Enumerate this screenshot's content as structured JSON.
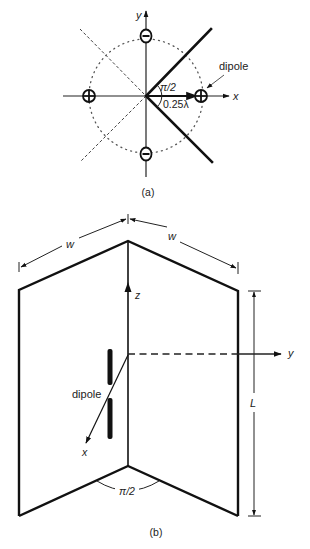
{
  "figure": {
    "part_a": {
      "caption": "(a)",
      "axis_x_label": "x",
      "axis_y_label": "y",
      "angle_label": "π/2",
      "distance_label": "0.25λ",
      "dipole_label": "dipole",
      "image_charges": [
        {
          "position": "right",
          "sign": "plus",
          "symbol": "+"
        },
        {
          "position": "left",
          "sign": "plus",
          "symbol": "+"
        },
        {
          "position": "top",
          "sign": "minus",
          "symbol": "−"
        },
        {
          "position": "bottom",
          "sign": "minus",
          "symbol": "−"
        }
      ]
    },
    "part_b": {
      "caption": "(b)",
      "width_label_left": "w",
      "width_label_right": "w",
      "length_label": "L",
      "axis_x_label": "x",
      "axis_y_label": "y",
      "axis_z_label": "z",
      "dipole_label": "dipole",
      "angle_label": "π/2"
    },
    "colors": {
      "ink": "#111111",
      "background": "#ffffff"
    }
  }
}
